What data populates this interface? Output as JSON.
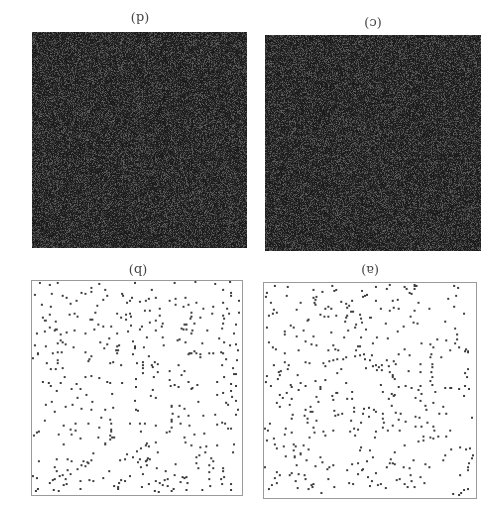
{
  "figure": {
    "orientation": "rotated 180 degrees",
    "panels": [
      {
        "id": "a",
        "label": "(a)",
        "type": "scatter",
        "points": 420,
        "seed": 11
      },
      {
        "id": "b",
        "label": "(b)",
        "type": "scatter",
        "points": 430,
        "seed": 23
      },
      {
        "id": "c",
        "label": "(c)",
        "type": "noise",
        "seed": 37
      },
      {
        "id": "d",
        "label": "(d)",
        "type": "noise",
        "seed": 53
      }
    ],
    "colors": {
      "dot": "#3a3a3a",
      "border": "#9a9a9a",
      "noise_base": "#2b2b2b"
    }
  }
}
